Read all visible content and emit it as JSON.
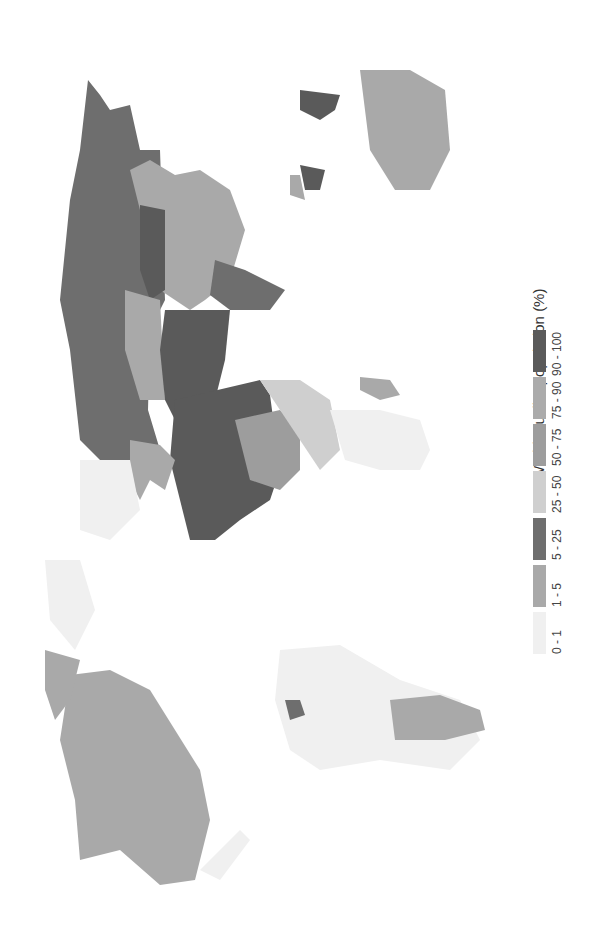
{
  "map": {
    "title": "World Muslim population (%)",
    "orientation": "rotated 90° counter-clockwise",
    "legend": {
      "title": "World Muslim population (%)",
      "classes": [
        {
          "label": "0 - 1",
          "color": "#f0f0f0"
        },
        {
          "label": "1 - 5",
          "color": "#a9a9a9"
        },
        {
          "label": "5 - 25",
          "color": "#6e6e6e"
        },
        {
          "label": "25 - 50",
          "color": "#cfcfcf"
        },
        {
          "label": "50 - 75",
          "color": "#9d9d9d"
        },
        {
          "label": "75 - 90",
          "color": "#ababab"
        },
        {
          "label": "90 - 100",
          "color": "#5a5a5a"
        }
      ]
    },
    "regions": [
      {
        "name": "Russia",
        "class": "5 - 25"
      },
      {
        "name": "China",
        "class": "1 - 5"
      },
      {
        "name": "Central Asia",
        "class": "90 - 100"
      },
      {
        "name": "Middle East",
        "class": "90 - 100"
      },
      {
        "name": "North Africa",
        "class": "90 - 100"
      },
      {
        "name": "Sahel / West Africa",
        "class": "50 - 75"
      },
      {
        "name": "Southern Africa",
        "class": "1 - 5"
      },
      {
        "name": "Europe",
        "class": "1 - 5"
      },
      {
        "name": "Indonesia",
        "class": "90 - 100"
      },
      {
        "name": "Australia",
        "class": "1 - 5"
      },
      {
        "name": "North America",
        "class": "1 - 5"
      },
      {
        "name": "South America",
        "class": "0 - 1"
      },
      {
        "name": "Suriname",
        "class": "5 - 25"
      },
      {
        "name": "Greenland",
        "class": "0 - 1"
      }
    ]
  }
}
